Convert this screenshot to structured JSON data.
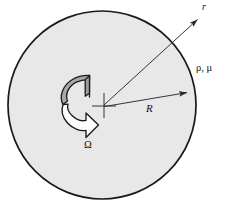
{
  "figure": {
    "labels": {
      "radial_coordinate": "r",
      "fluid_properties": "ρ, μ",
      "radius": "R",
      "angular_velocity": "Ω"
    },
    "colors": {
      "disc_fill": "#e8e8e8",
      "disc_stroke": "#1a1a1a",
      "paddle_top_fill": "#a8a8a8",
      "paddle_arrow_fill": "#fdfdfd",
      "paddle_stroke": "#1a1a1a",
      "line_stroke": "#2a2a2a",
      "background": "#ffffff",
      "text": "#111111"
    },
    "geometry": {
      "disc_center_x": 102,
      "disc_center_y": 105,
      "disc_radius": 94,
      "radius_arrow_from_x": 104,
      "radius_arrow_from_y": 106,
      "radius_arrow_to_x": 190,
      "radius_arrow_to_y": 92,
      "r_arrow_from_x": 104,
      "r_arrow_from_y": 105,
      "r_arrow_to_x": 200,
      "r_arrow_to_y": 17,
      "center_cross_half_size": 12
    },
    "icons": {
      "rotation": "curved-rotation-arrow-icon",
      "radius_arrow": "radius-arrow-icon",
      "radial_arrow": "radial-coordinate-arrow-icon",
      "center": "center-cross-marker-icon"
    }
  }
}
